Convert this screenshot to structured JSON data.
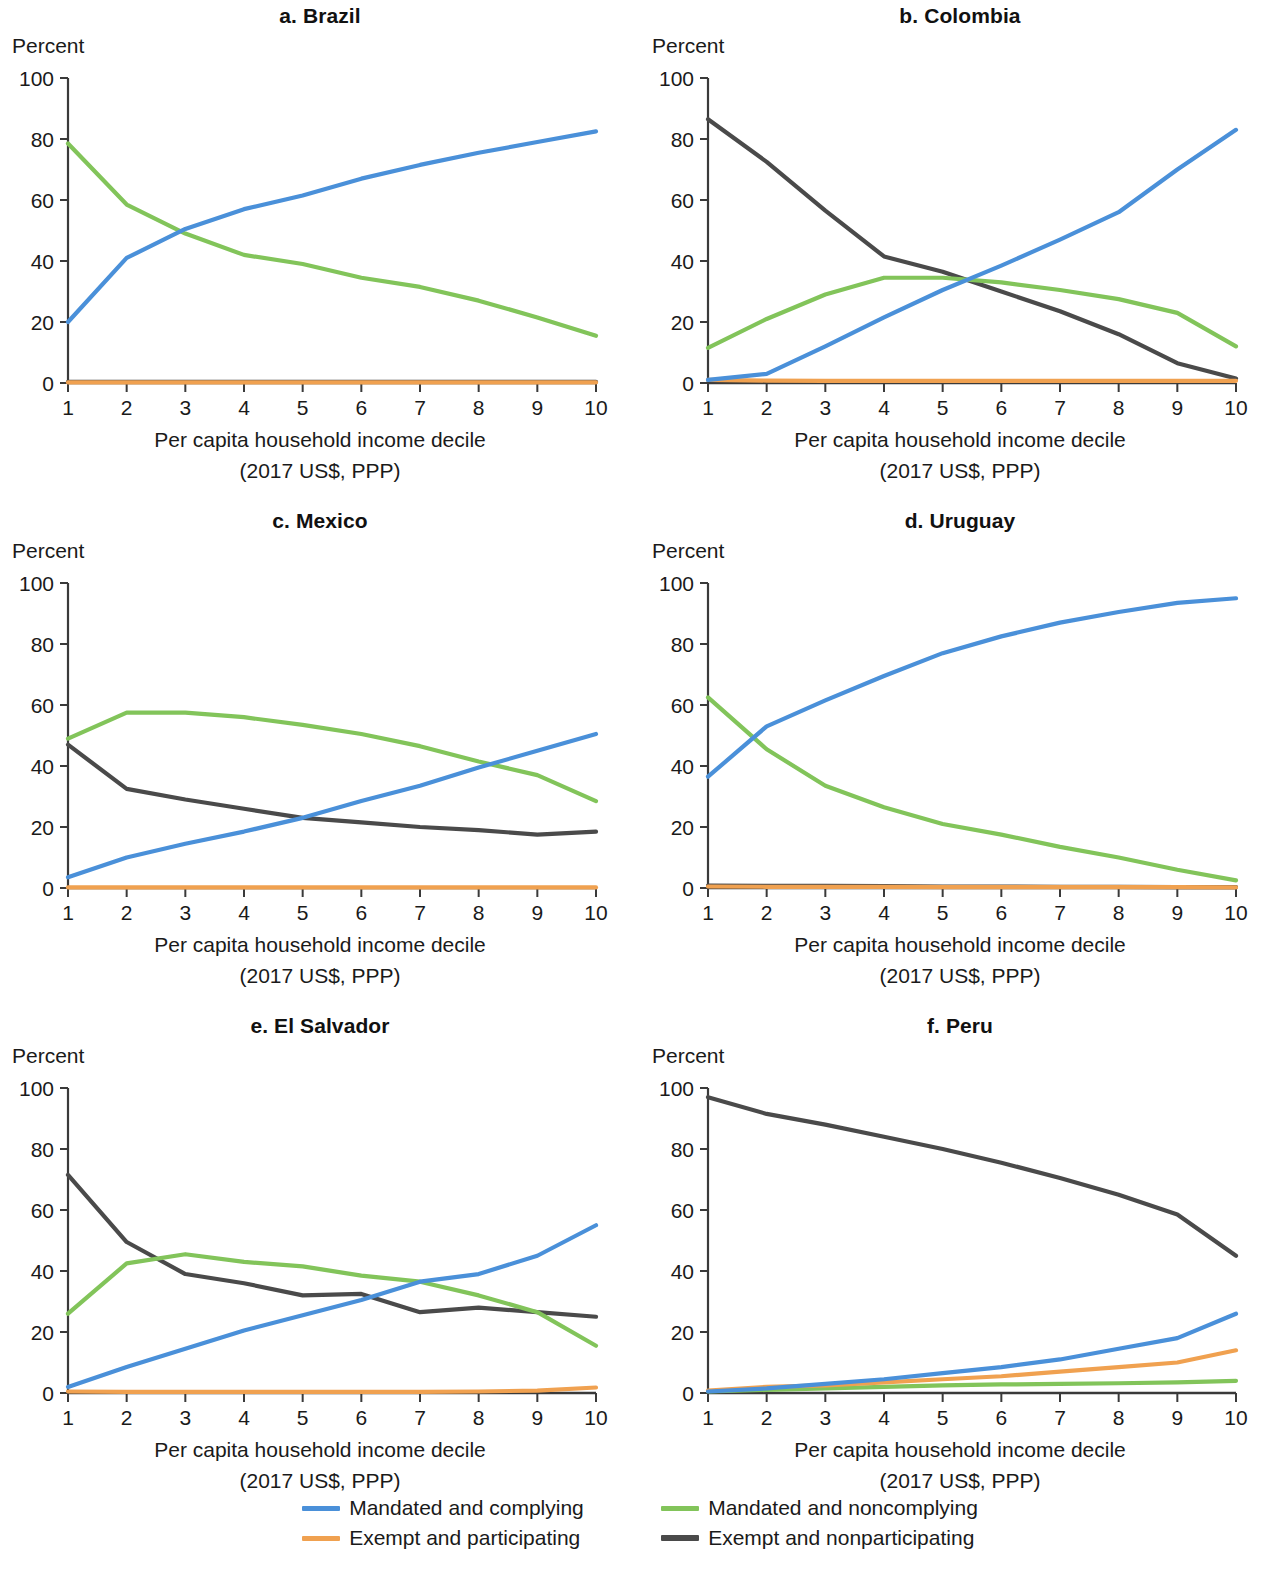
{
  "figure": {
    "y_axis_label": "Percent",
    "x_axis_caption_line1": "Per capita household income decile",
    "x_axis_caption_line2": "(2017 US$, PPP)"
  },
  "legend": {
    "items": [
      {
        "label": "Mandated and complying",
        "color": "#4a90d9",
        "key": "mandated_complying"
      },
      {
        "label": "Mandated and noncomplying",
        "color": "#82c45a",
        "key": "mandated_noncomplying"
      },
      {
        "label": "Exempt and participating",
        "color": "#f0a150",
        "key": "exempt_participating"
      },
      {
        "label": "Exempt and nonparticipating",
        "color": "#4a4a4a",
        "key": "exempt_nonparticipating"
      }
    ]
  },
  "chart_data": [
    {
      "type": "line",
      "panel_id": "a",
      "title": "a. Brazil",
      "xlabel": "Per capita household income decile (2017 US$, PPP)",
      "ylabel": "Percent",
      "x": [
        1,
        2,
        3,
        4,
        5,
        6,
        7,
        8,
        9,
        10
      ],
      "xtick_labels": [
        "1",
        "2",
        "3",
        "4",
        "5",
        "6",
        "7",
        "8",
        "9",
        "10"
      ],
      "ytick_labels": [
        "0",
        "20",
        "40",
        "60",
        "80",
        "100"
      ],
      "ylim": [
        0,
        100
      ],
      "xlim": [
        1,
        10
      ],
      "grid": false,
      "legend_position": "figure-bottom",
      "series": [
        {
          "name": "Mandated and complying",
          "color": "#4a90d9",
          "values": [
            20.0,
            41.0,
            50.5,
            57.0,
            61.5,
            67.0,
            71.5,
            75.5,
            79.0,
            82.5
          ]
        },
        {
          "name": "Mandated and noncomplying",
          "color": "#82c45a",
          "values": [
            78.5,
            58.5,
            49.0,
            42.0,
            39.0,
            34.5,
            31.5,
            27.0,
            21.5,
            15.5
          ]
        },
        {
          "name": "Exempt and participating",
          "color": "#f0a150",
          "values": [
            0.2,
            0.2,
            0.2,
            0.2,
            0.2,
            0.2,
            0.2,
            0.2,
            0.2,
            0.2
          ]
        },
        {
          "name": "Exempt and nonparticipating",
          "color": "#4a4a4a",
          "values": [
            0.4,
            0.4,
            0.4,
            0.4,
            0.4,
            0.4,
            0.4,
            0.4,
            0.4,
            0.4
          ]
        }
      ]
    },
    {
      "type": "line",
      "panel_id": "b",
      "title": "b. Colombia",
      "xlabel": "Per capita household income decile (2017 US$, PPP)",
      "ylabel": "Percent",
      "x": [
        1,
        2,
        3,
        4,
        5,
        6,
        7,
        8,
        9,
        10
      ],
      "xtick_labels": [
        "1",
        "2",
        "3",
        "4",
        "5",
        "6",
        "7",
        "8",
        "9",
        "10"
      ],
      "ytick_labels": [
        "0",
        "20",
        "40",
        "60",
        "80",
        "100"
      ],
      "ylim": [
        0,
        100
      ],
      "xlim": [
        1,
        10
      ],
      "grid": false,
      "legend_position": "figure-bottom",
      "series": [
        {
          "name": "Mandated and complying",
          "color": "#4a90d9",
          "values": [
            1.0,
            3.0,
            12.0,
            21.5,
            30.5,
            38.5,
            47.0,
            56.0,
            70.0,
            83.0
          ]
        },
        {
          "name": "Mandated and noncomplying",
          "color": "#82c45a",
          "values": [
            11.5,
            21.0,
            29.0,
            34.5,
            34.5,
            33.0,
            30.5,
            27.5,
            23.0,
            12.0
          ]
        },
        {
          "name": "Exempt and participating",
          "color": "#f0a150",
          "values": [
            1.0,
            0.8,
            0.7,
            0.7,
            0.7,
            0.7,
            0.7,
            0.7,
            0.7,
            0.7
          ]
        },
        {
          "name": "Exempt and nonparticipating",
          "color": "#4a4a4a",
          "values": [
            86.5,
            72.5,
            56.5,
            41.5,
            36.5,
            30.0,
            23.5,
            16.0,
            6.5,
            1.5
          ]
        }
      ]
    },
    {
      "type": "line",
      "panel_id": "c",
      "title": "c. Mexico",
      "xlabel": "Per capita household income decile (2017 US$, PPP)",
      "ylabel": "Percent",
      "x": [
        1,
        2,
        3,
        4,
        5,
        6,
        7,
        8,
        9,
        10
      ],
      "xtick_labels": [
        "1",
        "2",
        "3",
        "4",
        "5",
        "6",
        "7",
        "8",
        "9",
        "10"
      ],
      "ytick_labels": [
        "0",
        "20",
        "40",
        "60",
        "80",
        "100"
      ],
      "ylim": [
        0,
        100
      ],
      "xlim": [
        1,
        10
      ],
      "grid": false,
      "legend_position": "figure-bottom",
      "series": [
        {
          "name": "Mandated and complying",
          "color": "#4a90d9",
          "values": [
            3.5,
            10.0,
            14.5,
            18.5,
            23.0,
            28.5,
            33.5,
            39.5,
            45.0,
            50.5
          ]
        },
        {
          "name": "Mandated and noncomplying",
          "color": "#82c45a",
          "values": [
            49.0,
            57.5,
            57.5,
            56.0,
            53.5,
            50.5,
            46.5,
            41.5,
            37.0,
            28.5
          ]
        },
        {
          "name": "Exempt and participating",
          "color": "#f0a150",
          "values": [
            0.2,
            0.2,
            0.2,
            0.2,
            0.2,
            0.2,
            0.2,
            0.2,
            0.2,
            0.2
          ]
        },
        {
          "name": "Exempt and nonparticipating",
          "color": "#4a4a4a",
          "values": [
            47.0,
            32.5,
            29.0,
            26.0,
            23.0,
            21.5,
            20.0,
            19.0,
            17.5,
            18.5
          ]
        }
      ]
    },
    {
      "type": "line",
      "panel_id": "d",
      "title": "d. Uruguay",
      "xlabel": "Per capita household income decile (2017 US$, PPP)",
      "ylabel": "Percent",
      "x": [
        1,
        2,
        3,
        4,
        5,
        6,
        7,
        8,
        9,
        10
      ],
      "xtick_labels": [
        "1",
        "2",
        "3",
        "4",
        "5",
        "6",
        "7",
        "8",
        "9",
        "10"
      ],
      "ytick_labels": [
        "0",
        "20",
        "40",
        "60",
        "80",
        "100"
      ],
      "ylim": [
        0,
        100
      ],
      "xlim": [
        1,
        10
      ],
      "grid": false,
      "legend_position": "figure-bottom",
      "series": [
        {
          "name": "Mandated and complying",
          "color": "#4a90d9",
          "values": [
            36.5,
            53.0,
            61.5,
            69.5,
            77.0,
            82.5,
            87.0,
            90.5,
            93.5,
            95.0
          ]
        },
        {
          "name": "Mandated and noncomplying",
          "color": "#82c45a",
          "values": [
            62.5,
            45.5,
            33.5,
            26.5,
            21.0,
            17.5,
            13.5,
            10.0,
            6.0,
            2.5
          ]
        },
        {
          "name": "Exempt and participating",
          "color": "#f0a150",
          "values": [
            0.5,
            0.4,
            0.4,
            0.4,
            0.3,
            0.3,
            0.3,
            0.3,
            0.3,
            0.2
          ]
        },
        {
          "name": "Exempt and nonparticipating",
          "color": "#4a4a4a",
          "values": [
            0.8,
            0.7,
            0.7,
            0.6,
            0.5,
            0.5,
            0.4,
            0.4,
            0.3,
            0.3
          ]
        }
      ]
    },
    {
      "type": "line",
      "panel_id": "e",
      "title": "e. El Salvador",
      "xlabel": "Per capita household income decile (2017 US$, PPP)",
      "ylabel": "Percent",
      "x": [
        1,
        2,
        3,
        4,
        5,
        6,
        7,
        8,
        9,
        10
      ],
      "xtick_labels": [
        "1",
        "2",
        "3",
        "4",
        "5",
        "6",
        "7",
        "8",
        "9",
        "10"
      ],
      "ytick_labels": [
        "0",
        "20",
        "40",
        "60",
        "80",
        "100"
      ],
      "ylim": [
        0,
        100
      ],
      "xlim": [
        1,
        10
      ],
      "grid": false,
      "legend_position": "figure-bottom",
      "series": [
        {
          "name": "Mandated and complying",
          "color": "#4a90d9",
          "values": [
            2.0,
            8.5,
            14.5,
            20.5,
            25.5,
            30.5,
            36.5,
            39.0,
            45.0,
            55.0
          ]
        },
        {
          "name": "Mandated and noncomplying",
          "color": "#82c45a",
          "values": [
            26.0,
            42.5,
            45.5,
            43.0,
            41.5,
            38.5,
            36.5,
            32.0,
            26.5,
            15.5
          ]
        },
        {
          "name": "Exempt and participating",
          "color": "#f0a150",
          "values": [
            0.5,
            0.4,
            0.4,
            0.4,
            0.4,
            0.4,
            0.4,
            0.5,
            0.8,
            1.8
          ]
        },
        {
          "name": "Exempt and nonparticipating",
          "color": "#4a4a4a",
          "values": [
            71.5,
            49.5,
            39.0,
            36.0,
            32.0,
            32.5,
            26.5,
            28.0,
            26.5,
            25.0
          ]
        }
      ]
    },
    {
      "type": "line",
      "panel_id": "f",
      "title": "f. Peru",
      "xlabel": "Per capita household income decile (2017 US$, PPP)",
      "ylabel": "Percent",
      "x": [
        1,
        2,
        3,
        4,
        5,
        6,
        7,
        8,
        9,
        10
      ],
      "xtick_labels": [
        "1",
        "2",
        "3",
        "4",
        "5",
        "6",
        "7",
        "8",
        "9",
        "10"
      ],
      "ytick_labels": [
        "0",
        "20",
        "40",
        "60",
        "80",
        "100"
      ],
      "ylim": [
        0,
        100
      ],
      "xlim": [
        1,
        10
      ],
      "grid": false,
      "legend_position": "figure-bottom",
      "series": [
        {
          "name": "Mandated and complying",
          "color": "#4a90d9",
          "values": [
            0.5,
            1.5,
            3.0,
            4.5,
            6.5,
            8.5,
            11.0,
            14.5,
            18.0,
            26.0
          ]
        },
        {
          "name": "Mandated and noncomplying",
          "color": "#82c45a",
          "values": [
            0.5,
            1.0,
            1.5,
            2.0,
            2.5,
            2.8,
            3.0,
            3.2,
            3.5,
            4.0
          ]
        },
        {
          "name": "Exempt and participating",
          "color": "#f0a150",
          "values": [
            0.8,
            2.0,
            2.5,
            3.5,
            4.5,
            5.5,
            7.0,
            8.5,
            10.0,
            14.0
          ]
        },
        {
          "name": "Exempt and nonparticipating",
          "color": "#4a4a4a",
          "values": [
            97.0,
            91.5,
            88.0,
            84.0,
            80.0,
            75.5,
            70.5,
            65.0,
            58.5,
            45.0
          ]
        }
      ]
    }
  ]
}
